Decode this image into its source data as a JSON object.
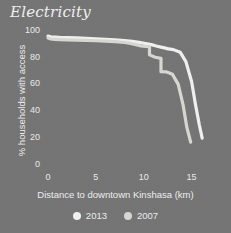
{
  "chart_data": {
    "type": "line",
    "title": "Electricity",
    "xlabel": "Distance to downtown Kinshasa (km)",
    "ylabel": "% households with access",
    "xlim": [
      0,
      16.5
    ],
    "ylim": [
      0,
      102
    ],
    "xticks": [
      0,
      5,
      10,
      15
    ],
    "xtick_labels": [
      "0",
      "5",
      "10",
      "15"
    ],
    "yticks": [
      0,
      20,
      40,
      60,
      80,
      100
    ],
    "ytick_labels": [
      "0",
      "20",
      "40",
      "60",
      "80",
      "100"
    ],
    "grid": false,
    "legend_position": "bottom-center",
    "series": [
      {
        "name": "2013",
        "color": "#f2f2f0",
        "x": [
          0.0,
          0.3,
          0.7,
          1.2,
          2.0,
          3.0,
          4.0,
          5.0,
          6.0,
          7.0,
          8.0,
          8.8,
          9.5,
          10.2,
          10.8,
          11.3,
          11.9,
          12.4,
          12.4,
          13.1,
          13.8,
          14.4,
          15.0,
          15.4,
          15.8,
          16.1
        ],
        "y": [
          96.0,
          95.5,
          95.3,
          95.0,
          94.8,
          94.6,
          94.3,
          94.0,
          93.6,
          93.2,
          92.6,
          92.0,
          91.3,
          90.4,
          89.6,
          88.6,
          87.6,
          86.8,
          86.6,
          85.9,
          84.0,
          77.0,
          62.0,
          45.0,
          30.0,
          20.0
        ]
      },
      {
        "name": "2007",
        "color": "#d8d8d4",
        "x": [
          0.0,
          0.3,
          0.7,
          1.2,
          2.0,
          3.0,
          4.0,
          5.0,
          6.0,
          7.0,
          8.0,
          8.6,
          9.2,
          9.7,
          10.2,
          10.6,
          10.6,
          11.2,
          11.8,
          11.8,
          12.4,
          13.0,
          13.6,
          14.1,
          14.5,
          14.9
        ],
        "y": [
          94.5,
          93.8,
          93.6,
          93.4,
          93.2,
          93.0,
          92.8,
          92.5,
          92.2,
          91.8,
          91.2,
          90.5,
          89.6,
          88.6,
          88.3,
          88.2,
          82.0,
          80.2,
          79.4,
          69.5,
          69.3,
          67.5,
          60.0,
          45.0,
          28.0,
          17.0
        ]
      }
    ]
  },
  "legend": {
    "items": [
      {
        "label": "2013",
        "color": "#f2f2f0"
      },
      {
        "label": "2007",
        "color": "#d8d8d4"
      }
    ]
  },
  "colors": {
    "background": "#757575",
    "text": "#f0f0f0",
    "series_2013": "#f2f2f0",
    "series_2007": "#d8d8d4"
  }
}
